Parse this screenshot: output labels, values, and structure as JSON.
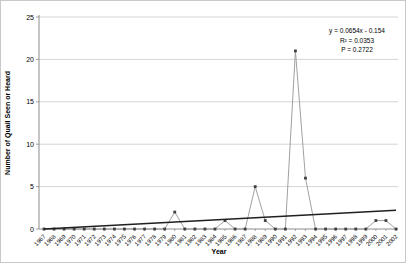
{
  "chart_data": {
    "type": "line",
    "title": "",
    "xlabel": "Year",
    "ylabel": "Number of Quail Seen or Heard",
    "ylim": [
      0,
      25
    ],
    "yticks": [
      0,
      5,
      10,
      15,
      20,
      25
    ],
    "categories": [
      "1967",
      "1968",
      "1969",
      "1970",
      "1971",
      "1972",
      "1973",
      "1974",
      "1975",
      "1976",
      "1977",
      "1978",
      "1979",
      "1980",
      "1981",
      "1982",
      "1983",
      "1984",
      "1985",
      "1986",
      "1987",
      "1988",
      "1989",
      "1990",
      "1991",
      "1992",
      "1993",
      "1994",
      "1995",
      "1996",
      "1997",
      "1998",
      "1999",
      "2000",
      "2001",
      "2002"
    ],
    "values": [
      0,
      0,
      0,
      0,
      0,
      0,
      0,
      0,
      0,
      0,
      0,
      0,
      0,
      2,
      0,
      0,
      0,
      0,
      1,
      0,
      0,
      5,
      1,
      0,
      0,
      21,
      6,
      0,
      0,
      0,
      0,
      0,
      0,
      1,
      1,
      0
    ],
    "legend": "none",
    "grid": "horizontal",
    "trendline": {
      "slope": 0.0654,
      "intercept": -0.154,
      "equation": "y = 0.0654x - 0.154",
      "r_squared_label": "R² = 0.0353",
      "p_value_label": "P = 0.2722"
    },
    "colors": {
      "gridline": "#c9c9c9",
      "axis": "#8c8c8c",
      "series_line": "#969696",
      "marker": "#404040",
      "trendline": "#1f1f1f",
      "background": "#ffffff"
    }
  }
}
